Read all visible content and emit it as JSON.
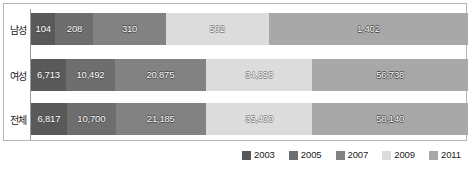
{
  "chart_data": {
    "type": "bar",
    "orientation": "horizontal",
    "stacked": true,
    "title": "",
    "xlabel": "",
    "ylabel": "",
    "grid": false,
    "legend_position": "bottom-right",
    "categories": [
      "남성",
      "여성",
      "전체"
    ],
    "series": [
      {
        "name": "2003",
        "color": "#595959",
        "values": [
          104,
          6713,
          6817
        ],
        "labels": [
          "104",
          "6,713",
          "6,817"
        ]
      },
      {
        "name": "2005",
        "color": "#6e6e6e",
        "values": [
          208,
          10492,
          10700
        ],
        "labels": [
          "208",
          "10,492",
          "10,700"
        ]
      },
      {
        "name": "2007",
        "color": "#828282",
        "values": [
          310,
          20875,
          21185
        ],
        "labels": [
          "310",
          "20,875",
          "21,185"
        ]
      },
      {
        "name": "2009",
        "color": "#dcdcdc",
        "values": [
          502,
          34898,
          35400
        ],
        "labels": [
          "502",
          "34,898",
          "35,400"
        ]
      },
      {
        "name": "2011",
        "color": "#a8a8a8",
        "values": [
          1402,
          56738,
          58140
        ],
        "labels": [
          "1,402",
          "56,738",
          "58,140"
        ]
      }
    ],
    "rows": [
      {
        "category": "남성",
        "segments": [
          {
            "series": "2003",
            "label": "104",
            "value": 104,
            "width_pct": 5.6,
            "color": "#595959",
            "light": false
          },
          {
            "series": "2005",
            "label": "208",
            "value": 208,
            "width_pct": 8.7,
            "color": "#6e6e6e",
            "light": false
          },
          {
            "series": "2007",
            "label": "310",
            "value": 310,
            "width_pct": 16.5,
            "color": "#828282",
            "light": false
          },
          {
            "series": "2009",
            "label": "502",
            "value": 502,
            "width_pct": 23.6,
            "color": "#dcdcdc",
            "light": true
          },
          {
            "series": "2011",
            "label": "1,402",
            "value": 1402,
            "width_pct": 45.6,
            "color": "#a8a8a8",
            "light": false
          }
        ]
      },
      {
        "category": "여성",
        "segments": [
          {
            "series": "2003",
            "label": "6,713",
            "value": 6713,
            "width_pct": 8.0,
            "color": "#595959",
            "light": false
          },
          {
            "series": "2005",
            "label": "10,492",
            "value": 10492,
            "width_pct": 11.2,
            "color": "#6e6e6e",
            "light": false
          },
          {
            "series": "2007",
            "label": "20,875",
            "value": 20875,
            "width_pct": 20.8,
            "color": "#828282",
            "light": false
          },
          {
            "series": "2009",
            "label": "34,898",
            "value": 34898,
            "width_pct": 24.4,
            "color": "#dcdcdc",
            "light": true
          },
          {
            "series": "2011",
            "label": "56,738",
            "value": 56738,
            "width_pct": 35.6,
            "color": "#a8a8a8",
            "light": false
          }
        ]
      },
      {
        "category": "전체",
        "segments": [
          {
            "series": "2003",
            "label": "6,817",
            "value": 6817,
            "width_pct": 8.2,
            "color": "#595959",
            "light": false
          },
          {
            "series": "2005",
            "label": "10,700",
            "value": 10700,
            "width_pct": 11.2,
            "color": "#6e6e6e",
            "light": false
          },
          {
            "series": "2007",
            "label": "21,185",
            "value": 21185,
            "width_pct": 20.6,
            "color": "#828282",
            "light": false
          },
          {
            "series": "2009",
            "label": "35,400",
            "value": 35400,
            "width_pct": 24.4,
            "color": "#dcdcdc",
            "light": true
          },
          {
            "series": "2011",
            "label": "58,140",
            "value": 58140,
            "width_pct": 35.6,
            "color": "#a8a8a8",
            "light": false
          }
        ]
      }
    ]
  },
  "legend": {
    "items": [
      {
        "label": "2003",
        "color": "#595959"
      },
      {
        "label": "2005",
        "color": "#6e6e6e"
      },
      {
        "label": "2007",
        "color": "#828282"
      },
      {
        "label": "2009",
        "color": "#dcdcdc"
      },
      {
        "label": "2011",
        "color": "#a8a8a8"
      }
    ]
  },
  "style": {
    "frame_border": "#b5b5b5",
    "axis_line": "#9a9a9a",
    "background": "#ffffff"
  }
}
